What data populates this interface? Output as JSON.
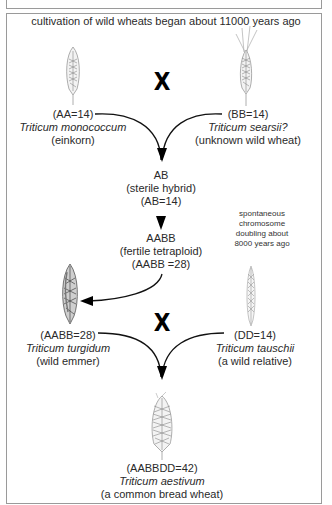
{
  "diagram": {
    "title": "cultivation of wild wheats began about 11000 years ago",
    "cross_symbol": "X",
    "nodes": {
      "einkorn": {
        "genome": "(AA=14)",
        "species": "Triticum monococcum",
        "common": "(einkorn)",
        "icon": "wheat-ear-einkorn-icon"
      },
      "searsii": {
        "genome": "(BB=14)",
        "species": "Triticum searsii?",
        "common": "(unknown wild wheat)",
        "icon": "wheat-ear-searsii-icon"
      },
      "hybrid": {
        "genome": "AB",
        "description": "(sterile hybrid)",
        "count": "(AB=14)"
      },
      "tetraploid": {
        "genome": "AABB",
        "description": "(fertile tetraploid)",
        "count": "(AABB =28)"
      },
      "emmer": {
        "genome": "(AABB=28)",
        "species": "Triticum turgidum",
        "common": "(wild emmer)",
        "icon": "wheat-ear-emmer-icon"
      },
      "tauschii": {
        "genome": "(DD=14)",
        "species": "Triticum tauschii",
        "common": "(a wild relative)",
        "icon": "wheat-ear-tauschii-icon"
      },
      "aestivum": {
        "genome": "(AABBDD=42)",
        "species": "Triticum aestivum",
        "common": "(a common bread wheat)",
        "icon": "wheat-ear-aestivum-icon"
      }
    },
    "annotation": {
      "lines": [
        "spontaneous",
        "chromosome",
        "doubling about",
        "8000 years ago"
      ]
    },
    "edges": [
      {
        "from": "einkorn",
        "to": "hybrid"
      },
      {
        "from": "searsii",
        "to": "hybrid"
      },
      {
        "from": "hybrid",
        "to": "tetraploid"
      },
      {
        "from": "tetraploid",
        "to": "emmer"
      },
      {
        "from": "emmer",
        "to": "aestivum"
      },
      {
        "from": "tauschii",
        "to": "aestivum"
      }
    ],
    "colors": {
      "frame": "#9a9a9a",
      "text": "#2a2a2a",
      "arrow": "#000000"
    }
  }
}
